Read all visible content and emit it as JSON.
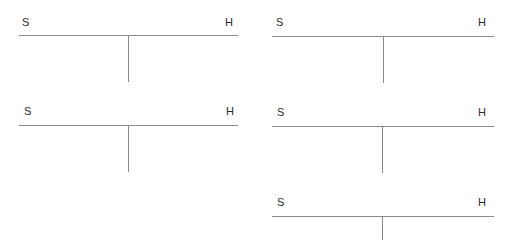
{
  "accounts": [
    {
      "left_label": "S",
      "right_label": "H"
    },
    {
      "left_label": "S",
      "right_label": "H"
    },
    {
      "left_label": "S",
      "right_label": "H"
    },
    {
      "left_label": "S",
      "right_label": "H"
    },
    {
      "left_label": "S",
      "right_label": "H"
    }
  ],
  "colors": {
    "line": "#8a8a8a",
    "text": "#2b2b2b",
    "background": "#ffffff"
  }
}
